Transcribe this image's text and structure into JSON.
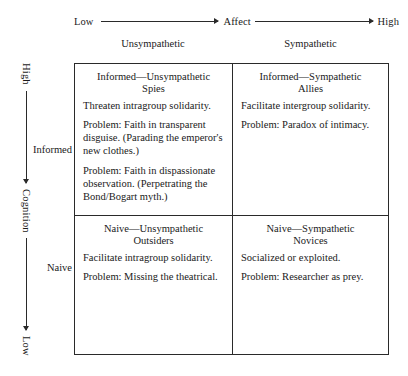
{
  "figure": {
    "type": "2x2-typology-matrix",
    "line_color": "#2a2a2a",
    "text_color": "#1a1a1a",
    "background": "#ffffff"
  },
  "horizontal_axis": {
    "name": "Affect",
    "low_label": "Low",
    "high_label": "High",
    "direction": "left-to-right increasing"
  },
  "vertical_axis": {
    "name": "Cognition",
    "high_label": "High",
    "low_label": "Low",
    "direction": "top-to-bottom decreasing"
  },
  "columns": [
    {
      "label": "Unsympathetic"
    },
    {
      "label": "Sympathetic"
    }
  ],
  "rows": [
    {
      "label": "Informed"
    },
    {
      "label": "Naive"
    }
  ],
  "cells": {
    "informed_unsympathetic": {
      "title": "Informed—Unsympathetic\nSpies",
      "paragraphs": [
        "Threaten intragroup solidarity.",
        "Problem: Faith in transparent disguise. (Parading the emperor's new clothes.)",
        "Problem: Faith in dispassionate observation. (Perpetrating the Bond/Bogart myth.)"
      ]
    },
    "informed_sympathetic": {
      "title": "Informed—Sympathetic\nAllies",
      "paragraphs": [
        "Facilitate intergroup solidarity.",
        "Problem: Paradox of intimacy."
      ]
    },
    "naive_unsympathetic": {
      "title": "Naive—Unsympathetic\nOutsiders",
      "paragraphs": [
        "Facilitate intragroup solidarity.",
        "Problem: Missing the theatrical."
      ]
    },
    "naive_sympathetic": {
      "title": "Naive—Sympathetic\nNovices",
      "paragraphs": [
        "Socialized or exploited.",
        "Problem: Researcher as prey."
      ]
    }
  }
}
